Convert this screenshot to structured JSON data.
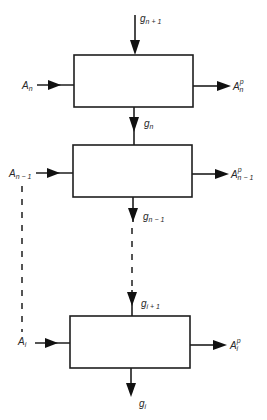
{
  "diagram": {
    "type": "block-flow",
    "stages": [
      {
        "id": "stage-n",
        "box": {
          "x": 74,
          "y": 55,
          "w": 119,
          "h": 52
        },
        "input": {
          "base": "A",
          "sub": "n",
          "sup": ""
        },
        "output": {
          "base": "A",
          "sub": "n",
          "sup": "p"
        },
        "top_in": {
          "base": "g",
          "sub": "n + 1"
        },
        "bottom_out": {
          "base": "g",
          "sub": "n"
        }
      },
      {
        "id": "stage-n-minus-1",
        "box": {
          "x": 73,
          "y": 145,
          "w": 119,
          "h": 52
        },
        "input": {
          "base": "A",
          "sub": "n − 1",
          "sup": ""
        },
        "output": {
          "base": "A",
          "sub": "n − 1",
          "sup": "p"
        },
        "bottom_out": {
          "base": "g",
          "sub": "n − 1"
        }
      },
      {
        "id": "stage-i",
        "box": {
          "x": 70,
          "y": 316,
          "w": 120,
          "h": 52
        },
        "input": {
          "base": "A",
          "sub": "i",
          "sup": ""
        },
        "output": {
          "base": "A",
          "sub": "i",
          "sup": "p"
        },
        "top_in": {
          "base": "g",
          "sub": "i + 1"
        },
        "bottom_out": {
          "base": "g",
          "sub": "i"
        }
      }
    ],
    "colors": {
      "stroke": "#1e1e1e",
      "background": "#ffffff",
      "text": "#2a2a2a"
    }
  }
}
